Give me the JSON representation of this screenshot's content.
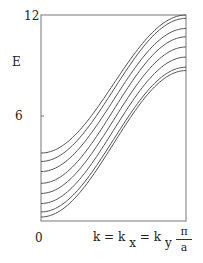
{
  "chart_data": {
    "type": "line",
    "title": "",
    "xlabel": "k = kx = ky",
    "ylabel": "E",
    "x_tick_labels": [
      "0",
      "π/a"
    ],
    "y_tick_labels": [
      "6",
      "12"
    ],
    "xlim": [
      0,
      1
    ],
    "ylim": [
      0,
      12
    ],
    "grid": false,
    "legend": null,
    "x": [
      0,
      0.1,
      0.2,
      0.3,
      0.4,
      0.5,
      0.6,
      0.7,
      0.8,
      0.9,
      1.0
    ],
    "series": [
      {
        "name": "band 1",
        "start": 3.8,
        "end": 12.0
      },
      {
        "name": "band 2",
        "start": 3.3,
        "end": 11.8
      },
      {
        "name": "band 3",
        "start": 2.7,
        "end": 11.2
      },
      {
        "name": "band 4",
        "start": 2.0,
        "end": 10.7
      },
      {
        "name": "band 5",
        "start": 1.4,
        "end": 10.1
      },
      {
        "name": "band 6",
        "start": 0.8,
        "end": 9.5
      },
      {
        "name": "band 7",
        "start": 0.3,
        "end": 8.9
      },
      {
        "name": "band 8",
        "start": 0.0,
        "end": 8.7
      }
    ]
  },
  "labels": {
    "y_axis": "E",
    "y_tick_top": "12",
    "y_tick_mid": "6",
    "x_origin": "0",
    "x_label_k": "k = k",
    "x_sub_x": "x",
    "x_eq": " = k",
    "x_sub_y": "y",
    "pi_num": "π",
    "pi_den": "a"
  },
  "colors": {
    "line": "#555555",
    "frame": "#777777"
  }
}
